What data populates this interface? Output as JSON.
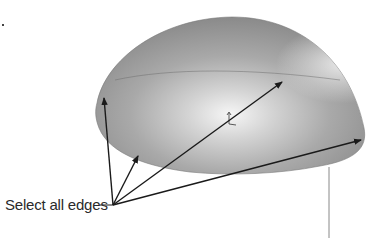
{
  "diagram": {
    "callout_label": "Select all edges",
    "shape": "dome",
    "colors": {
      "dome_base": "#8e8e8e",
      "dome_highlight": "#f4f4f4",
      "arrow": "#1a1a1a",
      "leader_line": "#7a7a7a"
    }
  }
}
